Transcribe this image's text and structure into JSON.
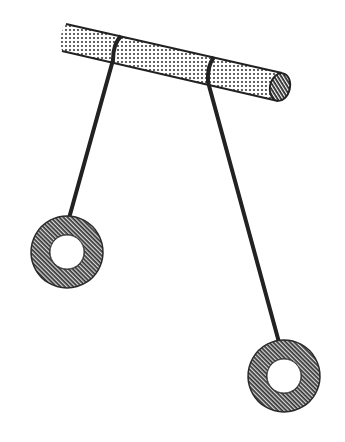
{
  "diagram": {
    "colors": {
      "ink": "#222222",
      "background": "#ffffff",
      "stipple": "#3a3a3a"
    },
    "rod": {
      "left_end": [
        66,
        37
      ],
      "right_end": [
        280,
        87
      ],
      "thickness": 28
    },
    "strings": [
      {
        "id": "left",
        "top": [
          116,
          48
        ],
        "bottom": [
          66,
          229
        ]
      },
      {
        "id": "right",
        "top": [
          209,
          70
        ],
        "bottom": [
          283,
          357
        ]
      }
    ],
    "rings": [
      {
        "id": "left",
        "center": [
          67,
          252
        ],
        "outer_radius": 36,
        "inner_radius": 17
      },
      {
        "id": "right",
        "center": [
          284,
          376
        ],
        "outer_radius": 36,
        "inner_radius": 17
      }
    ]
  }
}
